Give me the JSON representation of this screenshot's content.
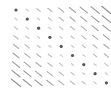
{
  "chart_data": {
    "type": "heatmap",
    "title": "",
    "xlabel": "",
    "ylabel": "",
    "grid": false,
    "legend": "none",
    "rows": 9,
    "cols": 9,
    "glyph": "oriented segment, diagonal = dot",
    "orientation": "descending (\\)",
    "origin": {
      "x": 16,
      "y": 10
    },
    "spacing": {
      "x": 11.3,
      "y": 9.1
    },
    "values": [
      [
        0,
        1,
        2,
        3,
        4,
        5,
        6,
        7,
        8
      ],
      [
        1,
        0,
        1,
        2,
        3,
        4,
        5,
        6,
        7
      ],
      [
        2,
        1,
        0,
        1,
        2,
        3,
        4,
        5,
        6
      ],
      [
        3,
        2,
        1,
        0,
        1,
        2,
        3,
        4,
        5
      ],
      [
        4,
        3,
        2,
        1,
        0,
        1,
        2,
        3,
        4
      ],
      [
        5,
        4,
        3,
        2,
        1,
        0,
        1,
        2,
        3
      ],
      [
        6,
        5,
        4,
        3,
        2,
        1,
        0,
        1,
        2
      ],
      [
        7,
        6,
        5,
        4,
        3,
        2,
        1,
        0,
        1
      ],
      [
        8,
        7,
        6,
        5,
        4,
        3,
        2,
        1,
        0
      ]
    ],
    "colors": {
      "dot": "#555555",
      "segment_light": "#d0d0d0",
      "segment_dark": "#8a8a8a"
    }
  }
}
